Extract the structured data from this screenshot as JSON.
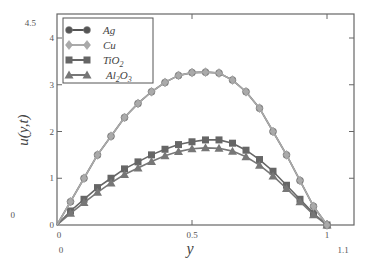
{
  "chart_data": {
    "type": "line",
    "title": "",
    "xlabel": "y",
    "ylabel": "u(y,t)",
    "xlim": [
      0,
      1.1
    ],
    "ylim": [
      0,
      4.5
    ],
    "x_ticks": [
      "0",
      "0.5",
      "1"
    ],
    "x_extra_labels": [
      "0",
      "1.1"
    ],
    "y_ticks": [
      "0",
      "1",
      "2",
      "3",
      "4"
    ],
    "y_extra_labels": [
      "4.5",
      "0"
    ],
    "grid": false,
    "legend_position": "upper left",
    "x": [
      0,
      0.05,
      0.1,
      0.15,
      0.2,
      0.25,
      0.3,
      0.35,
      0.4,
      0.45,
      0.5,
      0.55,
      0.6,
      0.65,
      0.7,
      0.75,
      0.8,
      0.85,
      0.9,
      0.95,
      1.0
    ],
    "series": [
      {
        "name": "Ag",
        "marker": "circle",
        "color": "#555555",
        "values": [
          0,
          0.5,
          1.0,
          1.5,
          1.9,
          2.3,
          2.6,
          2.85,
          3.05,
          3.2,
          3.26,
          3.27,
          3.25,
          3.1,
          2.85,
          2.5,
          2.0,
          1.5,
          0.95,
          0.4,
          0
        ]
      },
      {
        "name": "Cu",
        "marker": "diamond",
        "color": "#aaaaaa",
        "values": [
          0,
          0.5,
          1.0,
          1.5,
          1.9,
          2.3,
          2.6,
          2.85,
          3.05,
          3.2,
          3.26,
          3.27,
          3.25,
          3.1,
          2.85,
          2.5,
          2.0,
          1.5,
          0.95,
          0.4,
          0
        ]
      },
      {
        "name": "TiO2",
        "marker": "square",
        "color": "#666666",
        "values": [
          0,
          0.3,
          0.55,
          0.8,
          1.0,
          1.2,
          1.35,
          1.5,
          1.62,
          1.72,
          1.78,
          1.82,
          1.82,
          1.75,
          1.6,
          1.4,
          1.15,
          0.85,
          0.55,
          0.25,
          0
        ]
      },
      {
        "name": "Al2O3",
        "marker": "triangle",
        "color": "#777777",
        "values": [
          0,
          0.25,
          0.48,
          0.7,
          0.9,
          1.08,
          1.22,
          1.36,
          1.48,
          1.57,
          1.63,
          1.65,
          1.64,
          1.58,
          1.46,
          1.28,
          1.05,
          0.78,
          0.5,
          0.22,
          0
        ]
      }
    ]
  },
  "legend": {
    "items": [
      {
        "label": "Ag"
      },
      {
        "label": "Cu"
      },
      {
        "label": "TiO",
        "sub": "2"
      },
      {
        "label": "Al",
        "sub": "2",
        "label2": "O",
        "sub2": "3"
      }
    ]
  }
}
